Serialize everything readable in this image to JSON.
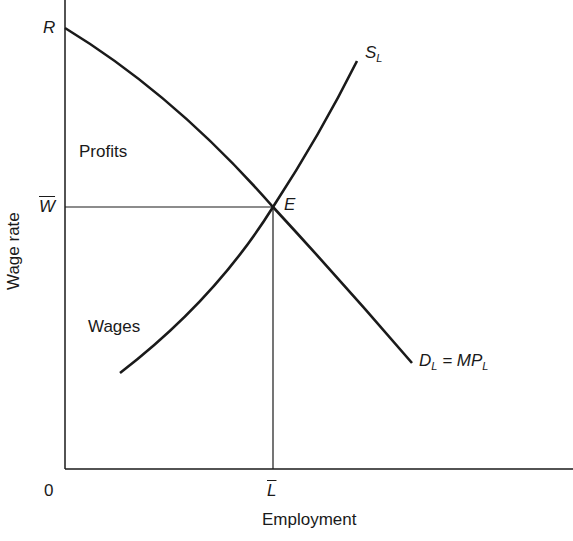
{
  "diagram": {
    "type": "labor-market-equilibrium",
    "axes": {
      "y_label": "Wage rate",
      "x_label": "Employment",
      "origin_label": "0"
    },
    "points": {
      "intercept_label": "R",
      "equilibrium_label": "E",
      "wage_label": "W",
      "employment_label": "L"
    },
    "curves": {
      "supply": {
        "main": "S",
        "subscript": "L"
      },
      "demand": {
        "d": "D",
        "d_sub": "L",
        "eq": " = MP",
        "mp_sub": "L"
      }
    },
    "regions": {
      "profits": "Profits",
      "wages": "Wages"
    },
    "colors": {
      "line": "#1a1a1a",
      "background": "#ffffff"
    }
  }
}
